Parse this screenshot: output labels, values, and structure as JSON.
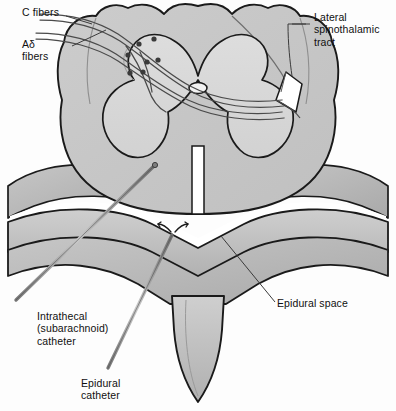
{
  "figure": {
    "type": "anatomical-illustration",
    "canvas": {
      "width": 396,
      "height": 411
    },
    "colors": {
      "background": "#fdfdfd",
      "white_matter": "#c9c9c9",
      "gray_matter": "#d8d8d8",
      "bone": "#bdbdbd",
      "bone_shadow": "#a8a8a8",
      "epidural_space": "#ffffff",
      "outline": "#1a1a1a",
      "fiber_line": "#555555",
      "synapse_dot": "#3a3a3a",
      "catheter": "#8d8d8d",
      "leader_line": "#3b3b3b",
      "text": "#101010"
    }
  },
  "labels": [
    {
      "id": "c-fibers",
      "text": "C fibers",
      "x": 22,
      "y": 6,
      "align": "left"
    },
    {
      "id": "adelta-fibers",
      "text": "Aδ\nfibers",
      "x": 22,
      "y": 38,
      "align": "left"
    },
    {
      "id": "lateral-tract",
      "text": "Lateral\nspinothalamic\ntract",
      "x": 314,
      "y": 11,
      "align": "left"
    },
    {
      "id": "epidural-space",
      "text": "Epidural space",
      "x": 277,
      "y": 297,
      "align": "left"
    },
    {
      "id": "intrathecal",
      "text": "Intrathecal\n(subarachnoid)\ncatheter",
      "x": 37,
      "y": 310,
      "align": "left"
    },
    {
      "id": "epidural-cath",
      "text": "Epidural\ncatheter",
      "x": 81,
      "y": 377,
      "align": "left"
    }
  ],
  "structures": [
    {
      "id": "white-matter",
      "name": "spinal cord white matter"
    },
    {
      "id": "gray-matter",
      "name": "butterfly-shaped gray matter"
    },
    {
      "id": "dorsal-horn",
      "name": "dorsal (posterior) horn"
    },
    {
      "id": "ventral-horn",
      "name": "ventral (anterior) horn"
    },
    {
      "id": "central-canal",
      "name": "central canal"
    },
    {
      "id": "anterior-fissure",
      "name": "anterior median fissure"
    },
    {
      "id": "dorsal-root",
      "name": "dorsal root nerve fibers"
    },
    {
      "id": "lateral-tract-wedge",
      "name": "lateral spinothalamic tract"
    },
    {
      "id": "vertebral-lamina",
      "name": "vertebral lamina"
    },
    {
      "id": "spinous-process",
      "name": "spinous process"
    },
    {
      "id": "epidural-space-region",
      "name": "epidural space"
    },
    {
      "id": "intrathecal-catheter",
      "name": "intrathecal catheter"
    },
    {
      "id": "epidural-catheter",
      "name": "epidural catheter"
    }
  ]
}
